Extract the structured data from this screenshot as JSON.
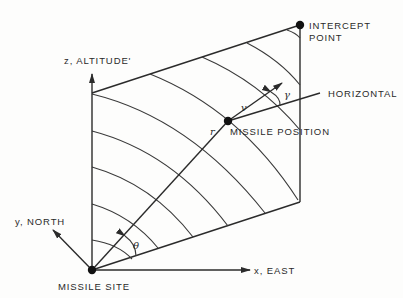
{
  "diagram": {
    "type": "missile intercept geometry",
    "labels": {
      "z_axis": "z, ALTITUDE'",
      "y_axis": "y, NORTH",
      "x_axis": "x, EAST",
      "missile_site": "MISSILE SITE",
      "intercept_point": "INTERCEPT",
      "intercept_point_line2": "POINT",
      "horizontal": "HORIZONTAL",
      "missile_position": "MISSILE POSITION"
    },
    "symbols": {
      "range": "r",
      "velocity": "v",
      "flight_path_angle": "γ",
      "elevation_angle": "θ"
    },
    "points": {
      "missile_site": [
        92,
        270
      ],
      "intercept_point": [
        300,
        25
      ],
      "missile_position": [
        228,
        121
      ],
      "plane_top_left": [
        92,
        93
      ],
      "plane_bottom_right": [
        300,
        202
      ]
    },
    "colors": {
      "line": "#2b2b2b",
      "background": "#fdfdfc"
    }
  }
}
